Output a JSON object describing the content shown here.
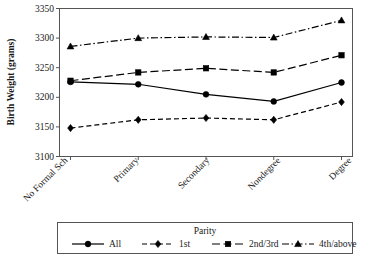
{
  "chart_data": {
    "type": "line",
    "title": "",
    "xlabel": "",
    "ylabel": "Birth Weight (grams)",
    "categories": [
      "No Formal Sch",
      "Primary",
      "Secondary",
      "Nondegree",
      "Degree"
    ],
    "ylim": [
      3100,
      3350
    ],
    "yticks": [
      3100,
      3150,
      3200,
      3250,
      3300,
      3350
    ],
    "ytick_labels": [
      "3100",
      "3150",
      "3200",
      "3250",
      "3300",
      "3350"
    ],
    "grid": false,
    "legend_position": "bottom",
    "legend_title": "Parity",
    "series": [
      {
        "name": "All",
        "values": [
          3226,
          3222,
          3205,
          3193,
          3225
        ],
        "marker": "circle",
        "dash": "solid",
        "color": "#000000"
      },
      {
        "name": "1st",
        "values": [
          3148,
          3162,
          3165,
          3162,
          3192
        ],
        "marker": "diamond",
        "dash": "dashed",
        "color": "#000000"
      },
      {
        "name": "2nd/3rd",
        "values": [
          3228,
          3242,
          3249,
          3242,
          3271
        ],
        "marker": "square",
        "dash": "longdash",
        "color": "#000000"
      },
      {
        "name": "4th/above",
        "values": [
          3286,
          3300,
          3302,
          3301,
          3330
        ],
        "marker": "triangle",
        "dash": "dashdot",
        "color": "#000000"
      }
    ]
  },
  "axes": {
    "y_title": "Birth Weight (grams)",
    "y_tick_0": "3100",
    "y_tick_1": "3150",
    "y_tick_2": "3200",
    "y_tick_3": "3250",
    "y_tick_4": "3300",
    "y_tick_5": "3350",
    "x_tick_0": "No Formal Sch",
    "x_tick_1": "Primary",
    "x_tick_2": "Secondary",
    "x_tick_3": "Nondegree",
    "x_tick_4": "Degree"
  },
  "legend": {
    "title": "Parity",
    "items": [
      {
        "label": "All"
      },
      {
        "label": "1st"
      },
      {
        "label": "2nd/3rd"
      },
      {
        "label": "4th/above"
      }
    ]
  },
  "colors": {
    "ink": "#000000",
    "frame": "#555555",
    "background": "#ffffff"
  }
}
